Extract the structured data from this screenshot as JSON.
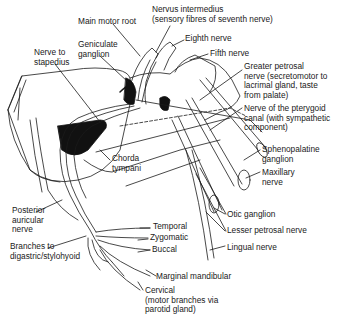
{
  "diagram": {
    "labels": [
      {
        "id": "main-motor-root",
        "text": "Main motor root",
        "x": 78,
        "y": 17
      },
      {
        "id": "nervus-intermedius",
        "text": "Nervus intermedius\n(sensory fibres of seventh nerve)",
        "x": 152,
        "y": 9
      },
      {
        "id": "eighth-nerve",
        "text": "Eighth nerve",
        "x": 185,
        "y": 34
      },
      {
        "id": "geniculate-ganglion",
        "text": "Geniculate\nganglion",
        "x": 78,
        "y": 41
      },
      {
        "id": "nerve-to-stapedius",
        "text": "Nerve to\nstapedius",
        "x": 34,
        "y": 48
      },
      {
        "id": "fifth-nerve",
        "text": "Fifth nerve",
        "x": 210,
        "y": 49
      },
      {
        "id": "greater-petrosal-nerve",
        "text": "Greater petrosal\nnerve (secretomotor to\nlacrimal gland, taste\nfrom palate)",
        "x": 244,
        "y": 64
      },
      {
        "id": "nerve-pterygoid-canal",
        "text": "Nerve of the pterygoid\ncanal (with sympathetic\ncomponent)",
        "x": 244,
        "y": 103
      },
      {
        "id": "chorda-tympani",
        "text": "Chorda\ntympani",
        "x": 112,
        "y": 155
      },
      {
        "id": "sphenopalatine-ganglion",
        "text": "Sphenopalatine\nganglion",
        "x": 262,
        "y": 146
      },
      {
        "id": "maxillary-nerve",
        "text": "Maxillary\nnerve",
        "x": 262,
        "y": 168
      },
      {
        "id": "posterior-auricular-nerve",
        "text": "Posterior\nauricular\nnerve",
        "x": 12,
        "y": 206
      },
      {
        "id": "otic-ganglion",
        "text": "Otic ganglion",
        "x": 227,
        "y": 210
      },
      {
        "id": "lesser-petrosal-nerve",
        "text": "Lesser petrosal nerve",
        "x": 227,
        "y": 227
      },
      {
        "id": "temporal",
        "text": "Temporal",
        "x": 153,
        "y": 224
      },
      {
        "id": "zygomatic",
        "text": "Zygomatic",
        "x": 150,
        "y": 235
      },
      {
        "id": "lingual-nerve",
        "text": "Lingual nerve",
        "x": 227,
        "y": 243
      },
      {
        "id": "buccal",
        "text": "Buccal",
        "x": 152,
        "y": 247
      },
      {
        "id": "branches-digastric",
        "text": "Branches to\ndigastric/stylohyoid",
        "x": 10,
        "y": 243
      },
      {
        "id": "marginal-mandibular",
        "text": "Marginal mandibular",
        "x": 156,
        "y": 273
      },
      {
        "id": "cervical",
        "text": "Cervical\n(motor branches via\nparotid gland)",
        "x": 145,
        "y": 287
      }
    ]
  },
  "colors": {
    "line": "#1a1a1a",
    "background": "#ffffff",
    "fill_dark": "#111111"
  }
}
